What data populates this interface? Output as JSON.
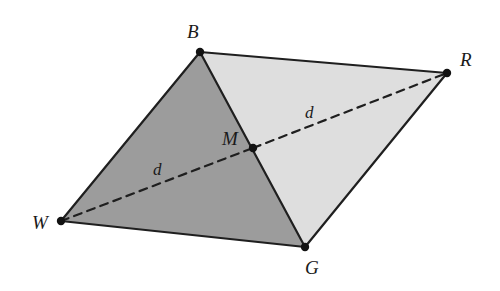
{
  "figure": {
    "background_color": "#ffffff",
    "width": 500,
    "height": 291
  },
  "colors": {
    "stroke": "#1f1f1f",
    "dark_fill": "#9c9c9c",
    "light_fill": "#dedede",
    "label_color": "#1a1a1a",
    "vertex_dot": "#121212"
  },
  "vertices": [
    {
      "id": "B",
      "label": "B",
      "x": 200,
      "y": 52,
      "label_x": 187,
      "label_y": 22
    },
    {
      "id": "R",
      "label": "R",
      "x": 447,
      "y": 73,
      "label_x": 460,
      "label_y": 50
    },
    {
      "id": "G",
      "label": "G",
      "x": 305,
      "y": 247,
      "label_x": 305,
      "label_y": 258
    },
    {
      "id": "W",
      "label": "W",
      "x": 61,
      "y": 221,
      "label_x": 32,
      "label_y": 213
    },
    {
      "id": "M",
      "label": "M",
      "x": 253,
      "y": 148,
      "label_x": 222,
      "label_y": 129
    }
  ],
  "regions": [
    {
      "id": "left-triangle-WBG",
      "name": "triangle-w-b-g",
      "fill": "#9c9c9c",
      "points": "61,221 200,52 305,247"
    },
    {
      "id": "right-triangle-BRG",
      "name": "triangle-b-r-g",
      "fill": "#dedede",
      "points": "200,52 447,73 305,247"
    }
  ],
  "solid_edges": [
    {
      "id": "edge-WB",
      "name": "edge-w-b",
      "x1": 61,
      "y1": 221,
      "x2": 200,
      "y2": 52
    },
    {
      "id": "edge-BR",
      "name": "edge-b-r",
      "x1": 200,
      "y1": 52,
      "x2": 447,
      "y2": 73
    },
    {
      "id": "edge-RG",
      "name": "edge-r-g",
      "x1": 447,
      "y1": 73,
      "x2": 305,
      "y2": 247
    },
    {
      "id": "edge-GW",
      "name": "edge-g-w",
      "x1": 305,
      "y1": 247,
      "x2": 61,
      "y2": 221
    },
    {
      "id": "edge-BG",
      "name": "edge-b-g",
      "x1": 200,
      "y1": 52,
      "x2": 305,
      "y2": 247
    }
  ],
  "dashed_edges": [
    {
      "id": "diagonal-WM",
      "name": "diagonal-w-m",
      "x1": 61,
      "y1": 221,
      "x2": 253,
      "y2": 148
    },
    {
      "id": "diagonal-MR",
      "name": "diagonal-m-r",
      "x1": 253,
      "y1": 148,
      "x2": 447,
      "y2": 73
    }
  ],
  "segment_labels": [
    {
      "id": "d-left",
      "label": "d",
      "x": 153,
      "y": 161,
      "for": "segment WM"
    },
    {
      "id": "d-right",
      "label": "d",
      "x": 305,
      "y": 104,
      "for": "segment MR"
    }
  ],
  "notation": {
    "dash_pattern": "8 6",
    "stroke_width": 2.2,
    "vertex_dot_radius": 4.2
  }
}
